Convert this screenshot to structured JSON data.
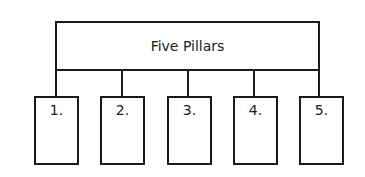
{
  "diagram": {
    "title": "Five Pillars",
    "pillars": [
      {
        "label": "1."
      },
      {
        "label": "2."
      },
      {
        "label": "3."
      },
      {
        "label": "4."
      },
      {
        "label": "5."
      }
    ]
  }
}
